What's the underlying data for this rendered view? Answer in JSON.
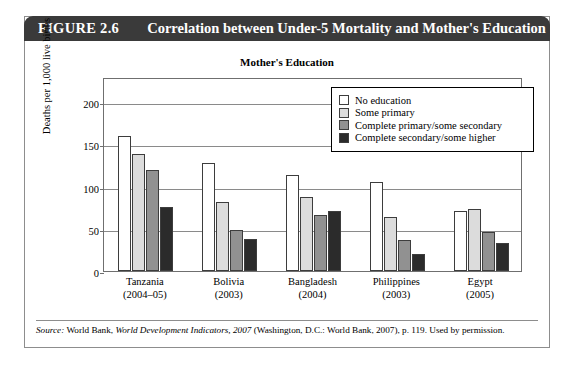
{
  "figure": {
    "number": "FIGURE 2.6",
    "title": "Correlation between Under-5 Mortality and Mother's Education"
  },
  "source": {
    "prefix": "Source:",
    "publisher": "World Bank,",
    "work": "World Development Indicators, 2007",
    "rest": "(Washington, D.C.: World Bank, 2007), p. 119. Used by permission."
  },
  "chart_data": {
    "type": "bar",
    "title": "Mother's Education",
    "xlabel": "",
    "ylabel": "Deaths per 1,000 live births",
    "ylim": [
      0,
      230
    ],
    "yticks": [
      0,
      50,
      100,
      150,
      200
    ],
    "ytick_labels": [
      "0",
      "50",
      "100",
      "150",
      "200"
    ],
    "grid": true,
    "legend_position": "top-right-inside",
    "categories": [
      "Tanzania",
      "Bolivia",
      "Bangladesh",
      "Philippines",
      "Egypt"
    ],
    "category_years": [
      "(2004–05)",
      "(2003)",
      "(2004)",
      "(2003)",
      "(2005)"
    ],
    "series": [
      {
        "name": "No education",
        "color": "#ffffff",
        "values": [
          160,
          128,
          114,
          106,
          71
        ]
      },
      {
        "name": "Some primary",
        "color": "#dcdcdc",
        "values": [
          139,
          82,
          88,
          64,
          73
        ]
      },
      {
        "name": "Complete primary/some secondary",
        "color": "#919191",
        "values": [
          120,
          49,
          67,
          37,
          46
        ]
      },
      {
        "name": "Complete secondary/some higher",
        "color": "#2b2b2b",
        "values": [
          76,
          38,
          71,
          20,
          33
        ]
      }
    ]
  },
  "colors": {
    "header_bar": "#3a3a3a",
    "frame": "#8d8d8d",
    "gridline": "#8a8a8a"
  }
}
